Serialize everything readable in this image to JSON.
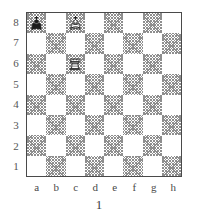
{
  "figure": {
    "type": "chess-diagram",
    "caption": "1",
    "board": {
      "files": [
        "a",
        "b",
        "c",
        "d",
        "e",
        "f",
        "g",
        "h"
      ],
      "ranks": [
        "8",
        "7",
        "6",
        "5",
        "4",
        "3",
        "2",
        "1"
      ],
      "orientation": "white-bottom",
      "light_square_color": "#ffffff",
      "dark_square_color": "#8e8e8e",
      "border_color": "#4a4a4a",
      "dark_square_pattern": "cross-hatch",
      "top_left_square_shade": "dark"
    },
    "pieces": [
      {
        "id": "black-king-a8",
        "piece": "king",
        "color": "black",
        "glyph": "♚",
        "square": "a8",
        "file": "a",
        "rank": "8",
        "file_index": 0,
        "rank_index": 0
      },
      {
        "id": "white-king-c8",
        "piece": "king",
        "color": "white",
        "glyph": "♔",
        "square": "c8",
        "file": "c",
        "rank": "8",
        "file_index": 2,
        "rank_index": 0
      },
      {
        "id": "white-rook-c6",
        "piece": "rook",
        "color": "white",
        "glyph": "♖",
        "square": "c6",
        "file": "c",
        "rank": "6",
        "file_index": 2,
        "rank_index": 2
      }
    ],
    "position_summary": "Black king a8, White king c8, White rook c6"
  }
}
